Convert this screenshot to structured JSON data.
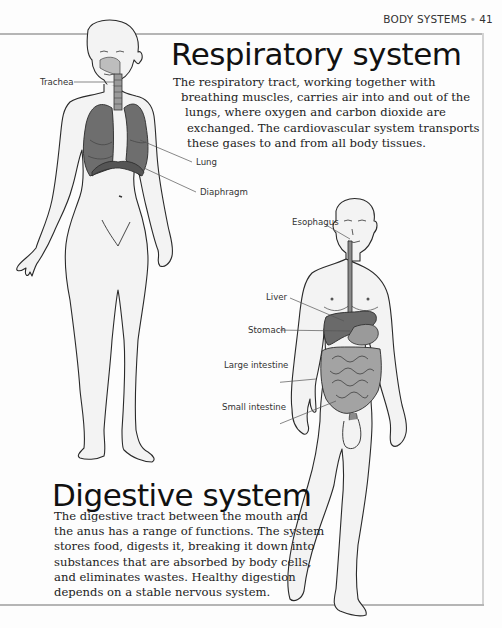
{
  "running_head": {
    "section": "BODY SYSTEMS",
    "separator": "•",
    "page_number": "41"
  },
  "respiratory": {
    "title": "Respiratory system",
    "paragraph_lines": [
      "The respiratory tract, working together with",
      "breathing muscles, carries air into and out of the",
      "lungs, where oxygen and carbon dioxide are",
      "exchanged. The cardiovascular system transports",
      "these gases to and from all body tissues."
    ],
    "labels": {
      "trachea": "Trachea",
      "lung": "Lung",
      "diaphragm": "Diaphragm"
    }
  },
  "digestive": {
    "title": "Digestive system",
    "paragraph_lines": [
      "The digestive tract between the mouth and",
      "the anus has a range of functions. The system",
      "stores food, digests it, breaking it down into",
      "substances that are absorbed by body cells,",
      "and eliminates wastes. Healthy digestion",
      "depends on a stable nervous system."
    ],
    "labels": {
      "esophagus": "Esophagus",
      "liver": "Liver",
      "stomach": "Stomach",
      "large_intestine": "Large intestine",
      "small_intestine": "Small intestine"
    }
  },
  "colors": {
    "outline": "#2a2a2a",
    "organ_fill": "#6e6e6e",
    "organ_dark": "#555555",
    "skin": "#f2f2f2",
    "rule": "#b5b5b5"
  }
}
